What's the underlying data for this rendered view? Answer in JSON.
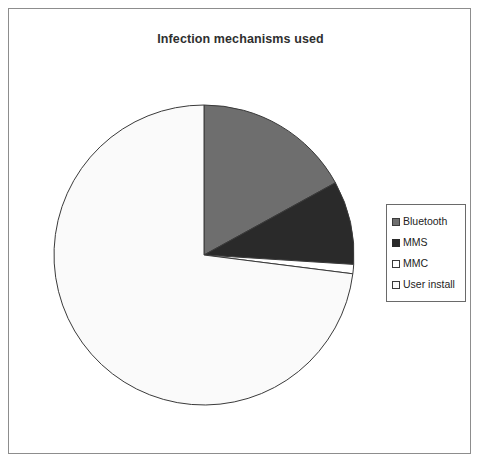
{
  "chart_title": "Infection mechanisms used",
  "legend": {
    "position": "right",
    "items": [
      {
        "label": "Bluetooth",
        "swatch_color": "#6e6e6e",
        "swatch_border": "#3a3a3a",
        "icon": "legend-swatch-icon"
      },
      {
        "label": "MMS",
        "swatch_color": "#2a2a2a",
        "swatch_border": "#2a2a2a",
        "icon": "legend-swatch-icon"
      },
      {
        "label": "MMC",
        "swatch_color": "#ffffff",
        "swatch_border": "#3a3a3a",
        "icon": "legend-swatch-icon"
      },
      {
        "label": "User install",
        "swatch_color": "#fafafa",
        "swatch_border": "#3a3a3a",
        "icon": "legend-swatch-icon"
      }
    ]
  },
  "chart_data": {
    "type": "pie",
    "title": "Infection mechanisms used",
    "xlabel": "",
    "ylabel": "",
    "grid": false,
    "legend_position": "right",
    "start_angle_deg": 0,
    "direction": "clockwise",
    "labels": [
      "Bluetooth",
      "MMS",
      "MMC",
      "User install"
    ],
    "values": [
      17,
      9,
      1,
      73
    ],
    "units": "percent",
    "colors": [
      "#6e6e6e",
      "#2a2a2a",
      "#ffffff",
      "#fafafa"
    ],
    "slices": [
      {
        "label": "Bluetooth",
        "value": 17,
        "start_deg": 0,
        "end_deg": 61.2,
        "color": "#6e6e6e"
      },
      {
        "label": "MMS",
        "value": 9,
        "start_deg": 61.2,
        "end_deg": 93.6,
        "color": "#2a2a2a"
      },
      {
        "label": "MMC",
        "value": 1,
        "start_deg": 93.6,
        "end_deg": 97.2,
        "color": "#ffffff"
      },
      {
        "label": "User install",
        "value": 73,
        "start_deg": 97.2,
        "end_deg": 360,
        "color": "#fafafa"
      }
    ],
    "geometry": {
      "center_x": 195,
      "center_y": 246,
      "radius": 150
    }
  }
}
